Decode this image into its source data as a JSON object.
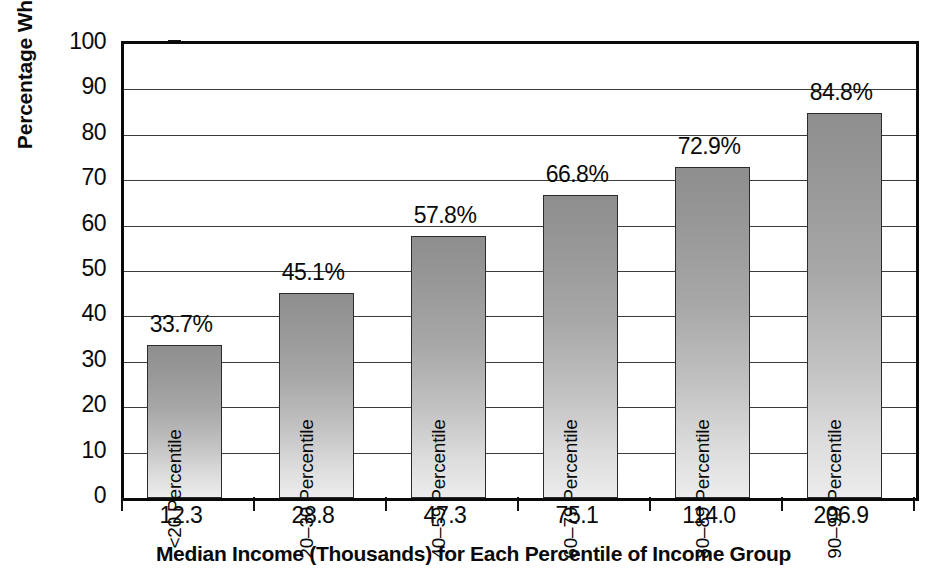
{
  "chart_data": {
    "type": "bar",
    "title": "",
    "xlabel": "Median Income (Thousands) for Each Percentile of Income Group",
    "ylabel": "Percentage Who Saved",
    "ylim": [
      0,
      100
    ],
    "ytick_labels": [
      "0",
      "10",
      "20",
      "30",
      "40",
      "50",
      "60",
      "70",
      "80",
      "90",
      "100"
    ],
    "ytick_values": [
      0,
      10,
      20,
      30,
      40,
      50,
      60,
      70,
      80,
      90,
      100
    ],
    "grid": "horizontal",
    "legend": "none",
    "categories": [
      "12.3",
      "28.8",
      "47.3",
      "75.1",
      "114.0",
      "206.9"
    ],
    "values": [
      33.7,
      45.1,
      57.8,
      66.8,
      72.9,
      84.8
    ],
    "value_labels": [
      "33.7%",
      "45.1%",
      "57.8%",
      "66.8%",
      "72.9%",
      "84.8%"
    ],
    "bar_inner_labels": [
      "<20 Percentile",
      "20–30 Percentile",
      "40–59 Percentile",
      "60–79 Percentile",
      "80–89 Percentile",
      "90–99 Percentile"
    ],
    "bar_fill_top_color": "#8e8e8e",
    "bar_fill_bottom_color": "#ececec",
    "bar_border_color": "#2b2b2b",
    "axis_color": "#0a0a0a",
    "gridline_color": "#3c3c3c",
    "background_color": "#ffffff"
  }
}
